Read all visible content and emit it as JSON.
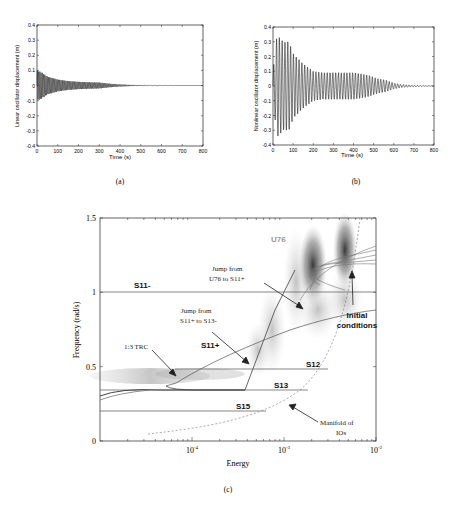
{
  "figure": {
    "captions": {
      "a": "(a)",
      "b": "(b)",
      "c": "(c)"
    }
  },
  "chart_data": [
    {
      "id": "a",
      "type": "line",
      "title": "",
      "xlabel": "Time (s)",
      "ylabel": "Linear oscillator displacement (m)",
      "xlim": [
        0,
        800
      ],
      "ylim": [
        -0.4,
        0.4
      ],
      "xticks": [
        "0",
        "100",
        "200",
        "300",
        "400",
        "500",
        "600",
        "700",
        "800"
      ],
      "yticks": [
        "0.4",
        "0.3",
        "0.2",
        "0.1",
        "0",
        "-0.1",
        "-0.2",
        "-0.3",
        "-0.4"
      ],
      "envelope": {
        "t": [
          0,
          20,
          50,
          100,
          150,
          200,
          250,
          300,
          350,
          400,
          450,
          500,
          600,
          700,
          800
        ],
        "amplitude": [
          0.1,
          0.09,
          0.06,
          0.04,
          0.03,
          0.025,
          0.022,
          0.02,
          0.012,
          0.007,
          0.004,
          0.002,
          0.001,
          0.0,
          0.0
        ]
      }
    },
    {
      "id": "b",
      "type": "line",
      "title": "",
      "xlabel": "Time (s)",
      "ylabel": "Nonlinear oscillator displacement (m)",
      "xlim": [
        0,
        800
      ],
      "ylim": [
        -0.4,
        0.4
      ],
      "xticks": [
        "0",
        "100",
        "200",
        "300",
        "400",
        "500",
        "600",
        "700",
        "800"
      ],
      "yticks": [
        "0.4",
        "0.3",
        "0.2",
        "0.1",
        "0",
        "-0.1",
        "-0.2",
        "-0.3",
        "-0.4"
      ],
      "envelope": {
        "t": [
          0,
          20,
          50,
          80,
          100,
          150,
          200,
          250,
          300,
          350,
          400,
          450,
          480,
          520,
          560,
          600,
          640,
          700,
          800
        ],
        "amplitude": [
          0.1,
          0.35,
          0.3,
          0.3,
          0.22,
          0.15,
          0.1,
          0.09,
          0.09,
          0.09,
          0.09,
          0.08,
          0.07,
          0.05,
          0.04,
          0.02,
          0.01,
          0.005,
          0.0
        ]
      }
    },
    {
      "id": "c",
      "type": "line",
      "title": "",
      "xlabel": "Energy",
      "ylabel": "Frequency (rad/s)",
      "xscale": "log",
      "xlim": [
        1e-05,
        0.01
      ],
      "ylim": [
        0,
        1.5
      ],
      "xticks": [
        "10-4",
        "10-3",
        "10-2"
      ],
      "yticks": [
        "1.5",
        "1",
        "0.5",
        "0"
      ],
      "branches": [
        {
          "name": "S11-",
          "frequency": 1.0
        },
        {
          "name": "S11+",
          "type": "curve"
        },
        {
          "name": "S12",
          "frequency": 0.48
        },
        {
          "name": "S13",
          "frequency": 0.33
        },
        {
          "name": "S15",
          "frequency": 0.2
        },
        {
          "name": "U76",
          "type": "curve"
        }
      ],
      "annotations": [
        "Jump from U76 to S11+",
        "Jump from S11+ to S13-",
        "1:3 TRC",
        "Initial conditions",
        "Manifold of IOs"
      ],
      "labels": {
        "S11m": "S11-",
        "S11p": "S11+",
        "S12": "S12",
        "S13": "S13",
        "S15": "S15",
        "U76": "U76",
        "jump1_l1": "Jump from",
        "jump1_l2": "U76 to S11+",
        "jump2_l1": "Jump from",
        "jump2_l2": "S11+ to S13-",
        "trc": "1:3 TRC",
        "init_l1": "Initial",
        "init_l2": "conditions",
        "manifold_l1": "Manifold of",
        "manifold_l2": "IOs"
      }
    }
  ]
}
